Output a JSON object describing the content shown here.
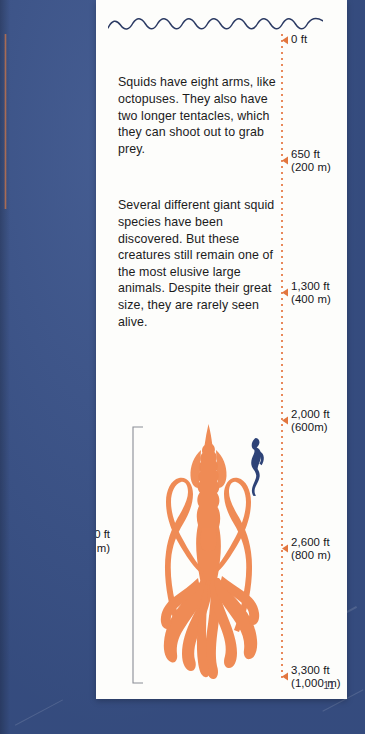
{
  "page": {
    "number": "11",
    "background_color": "#3b548c",
    "paper_color": "#fdfdfb",
    "accent_color": "#e2763f",
    "ink_color": "#17171b"
  },
  "wave": {
    "label": "sea-surface-wave"
  },
  "body": {
    "paragraph_1": "Squids have eight arms, like octopuses. They also have two longer tentacles, which they can shoot out to grab prey.",
    "paragraph_2": "Several different giant squid species have been discovered. But these creatures still remain one of the most elusive large animals. Despite their great size, they are rarely seen alive."
  },
  "depth_scale": {
    "markers": [
      {
        "feet": "0 ft",
        "metric": ""
      },
      {
        "feet": "650 ft",
        "metric": "(200 m)"
      },
      {
        "feet": "1,300 ft",
        "metric": "(400 m)"
      },
      {
        "feet": "2,000 ft",
        "metric": "(600m)"
      },
      {
        "feet": "2,600 ft",
        "metric": "(800 m)"
      },
      {
        "feet": "3,300 ft",
        "metric": "(1,000 m)"
      }
    ]
  },
  "illustration": {
    "squid_name": "giant-squid",
    "diver_name": "scuba-diver",
    "size_feet": "40 ft",
    "size_metric": "(12 m)",
    "squid_color": "#ef8b55",
    "diver_color": "#2e4377"
  }
}
